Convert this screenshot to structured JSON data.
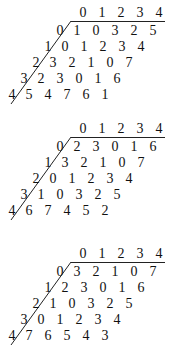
{
  "tables": [
    {
      "header": [
        "0",
        "1",
        "2",
        "3",
        "4"
      ],
      "row_labels": [
        "0",
        "1",
        "2",
        "3",
        "4"
      ],
      "rows": [
        [
          "1",
          "0",
          "3",
          "2",
          "5"
        ],
        [
          "0",
          "1",
          "2",
          "3",
          "4"
        ],
        [
          "3",
          "2",
          "1",
          "0",
          "7"
        ],
        [
          "2",
          "3",
          "0",
          "1",
          "6"
        ],
        [
          "5",
          "4",
          "7",
          "6",
          "1"
        ]
      ]
    },
    {
      "header": [
        "0",
        "1",
        "2",
        "3",
        "4"
      ],
      "row_labels": [
        "0",
        "1",
        "2",
        "3",
        "4"
      ],
      "rows": [
        [
          "2",
          "3",
          "0",
          "1",
          "6"
        ],
        [
          "3",
          "2",
          "1",
          "0",
          "7"
        ],
        [
          "0",
          "1",
          "2",
          "3",
          "4"
        ],
        [
          "1",
          "0",
          "3",
          "2",
          "5"
        ],
        [
          "6",
          "7",
          "4",
          "5",
          "2"
        ]
      ]
    },
    {
      "header": [
        "0",
        "1",
        "2",
        "3",
        "4"
      ],
      "row_labels": [
        "0",
        "1",
        "2",
        "3",
        "4"
      ],
      "rows": [
        [
          "3",
          "2",
          "1",
          "0",
          "7"
        ],
        [
          "2",
          "3",
          "0",
          "1",
          "6"
        ],
        [
          "1",
          "0",
          "3",
          "2",
          "5"
        ],
        [
          "0",
          "1",
          "2",
          "3",
          "4"
        ],
        [
          "7",
          "6",
          "5",
          "4",
          "3"
        ]
      ]
    }
  ]
}
